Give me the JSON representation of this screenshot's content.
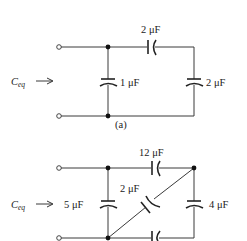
{
  "figure_a": {
    "caption": "(a)",
    "input_label": "C",
    "input_label_sub": "eq",
    "capacitors": {
      "top": "2 μF",
      "left_shunt": "1 μF",
      "right_shunt": "2 μF"
    }
  },
  "figure_b": {
    "input_label": "C",
    "input_label_sub": "eq",
    "capacitors": {
      "top": "12 μF",
      "left_shunt": "5 μF",
      "diagonal": "2 μF",
      "right_shunt": "4 μF",
      "bottom": ""
    }
  }
}
